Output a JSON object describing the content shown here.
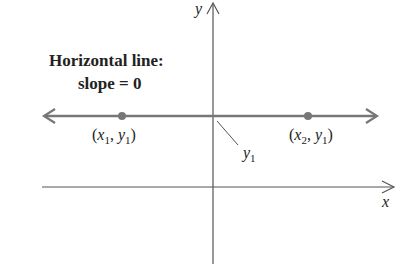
{
  "figure": {
    "title_line1": "Horizontal line:",
    "title_line2": "slope = 0",
    "axis_x_label": "x",
    "axis_y_label": "y",
    "points": [
      {
        "name": "point-1",
        "x_var": "x",
        "x_sub": "1",
        "y_var": "y",
        "y_sub": "1"
      },
      {
        "name": "point-2",
        "x_var": "x",
        "x_sub": "2",
        "y_var": "y",
        "y_sub": "1"
      }
    ],
    "intercept_label": {
      "var": "y",
      "sub": "1"
    },
    "punctuation": {
      "open": "(",
      "comma": ", ",
      "close": ")"
    },
    "colors": {
      "axes": "#555555",
      "line": "#777777",
      "points": "#777777",
      "text": "#222222"
    }
  }
}
